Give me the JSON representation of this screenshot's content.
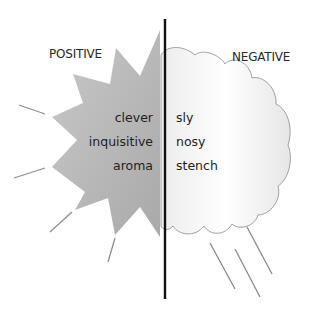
{
  "diagram": {
    "left_heading": "POSITIVE",
    "right_heading": "NEGATIVE",
    "positive_words": [
      "clever",
      "inquisitive",
      "aroma"
    ],
    "negative_words": [
      "sly",
      "nosy",
      "stench"
    ],
    "colors": {
      "star_fill": "#b5b5b5",
      "cloud_fill": "#f4f4f4",
      "cloud_stroke": "#9a9a9a",
      "divider": "#111111",
      "rays": "#8a8a8a"
    },
    "icons": {
      "left_shape": "starburst-icon",
      "right_shape": "rain-cloud-icon"
    }
  }
}
